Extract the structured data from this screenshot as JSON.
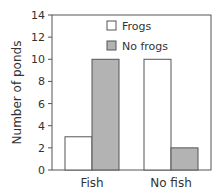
{
  "chart_data": {
    "type": "bar",
    "title": "",
    "xlabel": "",
    "ylabel": "Number of ponds",
    "ylim": [
      0,
      14
    ],
    "yticks": [
      0,
      2,
      4,
      6,
      8,
      10,
      12,
      14
    ],
    "categories": [
      "Fish",
      "No fish"
    ],
    "series": [
      {
        "name": "Frogs",
        "values": [
          3,
          10
        ],
        "color": "#ffffff"
      },
      {
        "name": "No frogs",
        "values": [
          10,
          2
        ],
        "color": "#b3b3b3"
      }
    ],
    "legend_position": "upper right",
    "grid": false
  }
}
